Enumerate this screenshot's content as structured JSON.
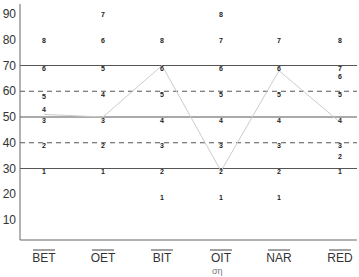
{
  "chart_data": {
    "type": "line",
    "title": "",
    "xlabel": "",
    "ylabel": "",
    "ylim": [
      5,
      95
    ],
    "yticks": [
      10,
      20,
      30,
      40,
      50,
      60,
      70,
      80,
      90
    ],
    "categories": [
      "BET",
      "OET",
      "BIT",
      "OIT",
      "NAR",
      "RED"
    ],
    "category_labels_overlined": true,
    "grid": false,
    "legend": null,
    "reference_lines": [
      {
        "y": 70,
        "style": "solid"
      },
      {
        "y": 60,
        "style": "dashed"
      },
      {
        "y": 50,
        "style": "solid"
      },
      {
        "y": 40,
        "style": "dashed"
      },
      {
        "y": 30,
        "style": "solid"
      }
    ],
    "scale_markers": [
      {
        "category": "BET",
        "points": [
          {
            "label": "1",
            "y": 29
          },
          {
            "label": "2",
            "y": 39
          },
          {
            "label": "3",
            "y": 49
          },
          {
            "label": "4",
            "y": 53
          },
          {
            "label": "5",
            "y": 58
          },
          {
            "label": "6",
            "y": 69
          },
          {
            "label": "8",
            "y": 80
          }
        ]
      },
      {
        "category": "OET",
        "points": [
          {
            "label": "1",
            "y": 29
          },
          {
            "label": "2",
            "y": 39
          },
          {
            "label": "3",
            "y": 49
          },
          {
            "label": "4",
            "y": 59
          },
          {
            "label": "5",
            "y": 69
          },
          {
            "label": "6",
            "y": 80
          },
          {
            "label": "7",
            "y": 90
          }
        ]
      },
      {
        "category": "BIT",
        "points": [
          {
            "label": "1",
            "y": 19
          },
          {
            "label": "2",
            "y": 29
          },
          {
            "label": "3",
            "y": 39
          },
          {
            "label": "4",
            "y": 49
          },
          {
            "label": "5",
            "y": 59
          },
          {
            "label": "6",
            "y": 69
          },
          {
            "label": "8",
            "y": 80
          }
        ]
      },
      {
        "category": "OIT",
        "points": [
          {
            "label": "1",
            "y": 19
          },
          {
            "label": "2",
            "y": 29
          },
          {
            "label": "3",
            "y": 39
          },
          {
            "label": "4",
            "y": 49
          },
          {
            "label": "5",
            "y": 59
          },
          {
            "label": "6",
            "y": 69
          },
          {
            "label": "7",
            "y": 80
          },
          {
            "label": "8",
            "y": 90
          }
        ]
      },
      {
        "category": "NAR",
        "points": [
          {
            "label": "1",
            "y": 19
          },
          {
            "label": "2",
            "y": 29
          },
          {
            "label": "3",
            "y": 39
          },
          {
            "label": "4",
            "y": 49
          },
          {
            "label": "5",
            "y": 59
          },
          {
            "label": "6",
            "y": 69
          },
          {
            "label": "7",
            "y": 80
          }
        ]
      },
      {
        "category": "RED",
        "points": [
          {
            "label": "1",
            "y": 29
          },
          {
            "label": "2",
            "y": 35
          },
          {
            "label": "3",
            "y": 39
          },
          {
            "label": "4",
            "y": 49
          },
          {
            "label": "5",
            "y": 59
          },
          {
            "label": "6",
            "y": 66
          },
          {
            "label": "7",
            "y": 69
          },
          {
            "label": "8",
            "y": 80
          }
        ]
      }
    ],
    "series": [
      {
        "name": "profile",
        "color": "#cccccc",
        "values": [
          51,
          50,
          70,
          29,
          68,
          48
        ]
      }
    ]
  },
  "footer": {
    "fragment": "ση"
  }
}
